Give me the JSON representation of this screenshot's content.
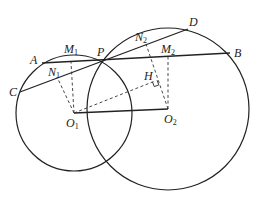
{
  "diagram": {
    "type": "geometry",
    "circles": [
      {
        "name": "circle-O1",
        "center": "O1",
        "cx": 74,
        "cy": 113,
        "r": 58
      },
      {
        "name": "circle-O2",
        "center": "O2",
        "cx": 168,
        "cy": 109,
        "r": 81
      }
    ],
    "points": {
      "A": {
        "label": "A",
        "sub": "",
        "x": 42,
        "y": 63,
        "lx": 30,
        "ly": 64
      },
      "C": {
        "label": "C",
        "sub": "",
        "x": 20,
        "y": 92,
        "lx": 9,
        "ly": 96
      },
      "P": {
        "label": "P",
        "sub": "",
        "x": 102,
        "y": 62,
        "lx": 97,
        "ly": 56
      },
      "D": {
        "label": "D",
        "sub": "",
        "x": 188,
        "y": 29,
        "lx": 189,
        "ly": 26
      },
      "B": {
        "label": "B",
        "sub": "",
        "x": 230,
        "y": 53,
        "lx": 234,
        "ly": 57
      },
      "M1": {
        "label": "M",
        "sub": "1",
        "x": 71,
        "y": 62,
        "lx": 64,
        "ly": 53
      },
      "N1": {
        "label": "N",
        "sub": "1",
        "x": 57,
        "y": 77,
        "lx": 48,
        "ly": 76
      },
      "M2": {
        "label": "M",
        "sub": "2",
        "x": 168,
        "y": 57,
        "lx": 161,
        "ly": 53
      },
      "N2": {
        "label": "N",
        "sub": "2",
        "x": 146,
        "y": 44,
        "lx": 135,
        "ly": 41
      },
      "H": {
        "label": "H",
        "sub": "",
        "x": 155,
        "y": 81,
        "lx": 144,
        "ly": 80
      },
      "O1": {
        "label": "O",
        "sub": "1",
        "x": 74,
        "y": 113,
        "lx": 66,
        "ly": 127
      },
      "O2": {
        "label": "O",
        "sub": "2",
        "x": 168,
        "y": 109,
        "lx": 164,
        "ly": 123
      }
    },
    "segments_solid": [
      [
        "A",
        "B"
      ],
      [
        "C",
        "D"
      ],
      [
        "O1",
        "O2"
      ]
    ],
    "segments_dashed": [
      [
        "O1",
        "M1"
      ],
      [
        "O1",
        "N1"
      ],
      [
        "O2",
        "M2"
      ],
      [
        "O2",
        "N2"
      ],
      [
        "O1",
        "H"
      ]
    ],
    "right_angle_at": "H"
  },
  "labels": {
    "A": "A",
    "B": "B",
    "C": "C",
    "D": "D",
    "P": "P",
    "H": "H",
    "M": "M",
    "N": "N",
    "O": "O",
    "sub1": "1",
    "sub2": "2"
  }
}
